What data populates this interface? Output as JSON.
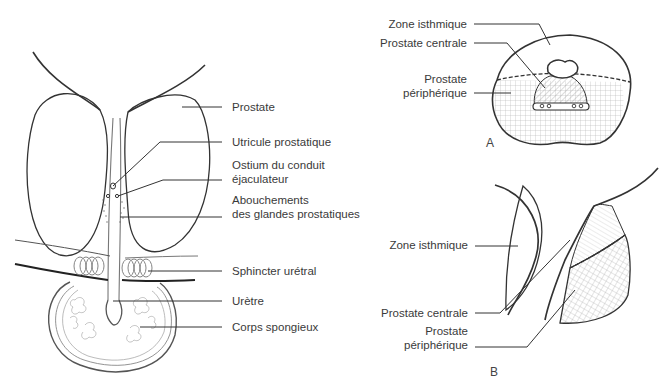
{
  "figure_main": {
    "labels": {
      "prostate": "Prostate",
      "utricule": "Utricule prostatique",
      "ostium_1": "Ostium du conduit",
      "ostium_2": "éjaculateur",
      "abouchements_1": "Abouchements",
      "abouchements_2": "des glandes prostatiques",
      "sphincter": "Sphincter urétral",
      "uretre": "Urètre",
      "corps": "Corps spongieux"
    }
  },
  "figure_a": {
    "tag": "A",
    "labels": {
      "zone_isthmique": "Zone isthmique",
      "prostate_centrale": "Prostate centrale",
      "peripherique_1": "Prostate",
      "peripherique_2": "périphérique"
    }
  },
  "figure_b": {
    "tag": "B",
    "labels": {
      "zone_isthmique": "Zone isthmique",
      "prostate_centrale": "Prostate centrale",
      "peripherique_1": "Prostate",
      "peripherique_2": "périphérique"
    }
  },
  "colors": {
    "ink": "#333333",
    "hatch": "#9a9a9a",
    "text": "#3a3a3a"
  }
}
